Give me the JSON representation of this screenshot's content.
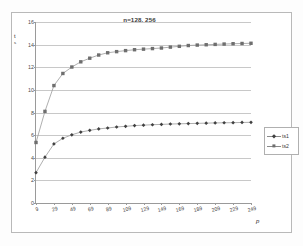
{
  "chart_data": {
    "type": "line",
    "title": "n=128, 256",
    "xlabel": "p",
    "ylabel_line1": "t",
    "ylabel_line2": "s",
    "ylabel_full": "t s",
    "x": [
      9,
      19,
      29,
      39,
      49,
      59,
      69,
      79,
      89,
      99,
      109,
      119,
      129,
      139,
      149,
      159,
      169,
      179,
      189,
      199,
      209,
      219,
      229,
      239,
      249
    ],
    "xlim": [
      9,
      249
    ],
    "ylim": [
      0,
      16
    ],
    "yticks": [
      0,
      2,
      4,
      6,
      8,
      10,
      12,
      14,
      16
    ],
    "xticks": [
      9,
      29,
      49,
      69,
      89,
      109,
      129,
      149,
      169,
      189,
      209,
      229,
      249
    ],
    "xtick_labels": [
      "9",
      "29",
      "49",
      "69",
      "89",
      "109",
      "129",
      "149",
      "169",
      "189",
      "209",
      "229",
      "249"
    ],
    "ytick_labels": [
      "0",
      "2",
      "4",
      "6",
      "8",
      "10",
      "12",
      "14",
      "16"
    ],
    "grid": true,
    "legend_position": "right",
    "series": [
      {
        "name": "ts1",
        "marker": "diamond",
        "color": "#404040",
        "values": [
          2.68,
          4.05,
          5.22,
          5.72,
          6.03,
          6.27,
          6.42,
          6.55,
          6.63,
          6.72,
          6.78,
          6.84,
          6.88,
          6.92,
          6.95,
          6.98,
          7.0,
          7.02,
          7.04,
          7.06,
          7.08,
          7.09,
          7.1,
          7.12,
          7.13
        ]
      },
      {
        "name": "ts2",
        "marker": "square",
        "color": "#6e6e6e",
        "values": [
          5.35,
          8.1,
          10.38,
          11.45,
          12.02,
          12.48,
          12.8,
          13.08,
          13.28,
          13.38,
          13.47,
          13.55,
          13.6,
          13.65,
          13.7,
          13.78,
          13.85,
          13.92,
          13.96,
          13.99,
          14.02,
          14.05,
          14.08,
          14.1,
          14.12
        ]
      }
    ]
  },
  "legend": {
    "entries": [
      {
        "label": "ts1"
      },
      {
        "label": "ts2"
      }
    ]
  }
}
